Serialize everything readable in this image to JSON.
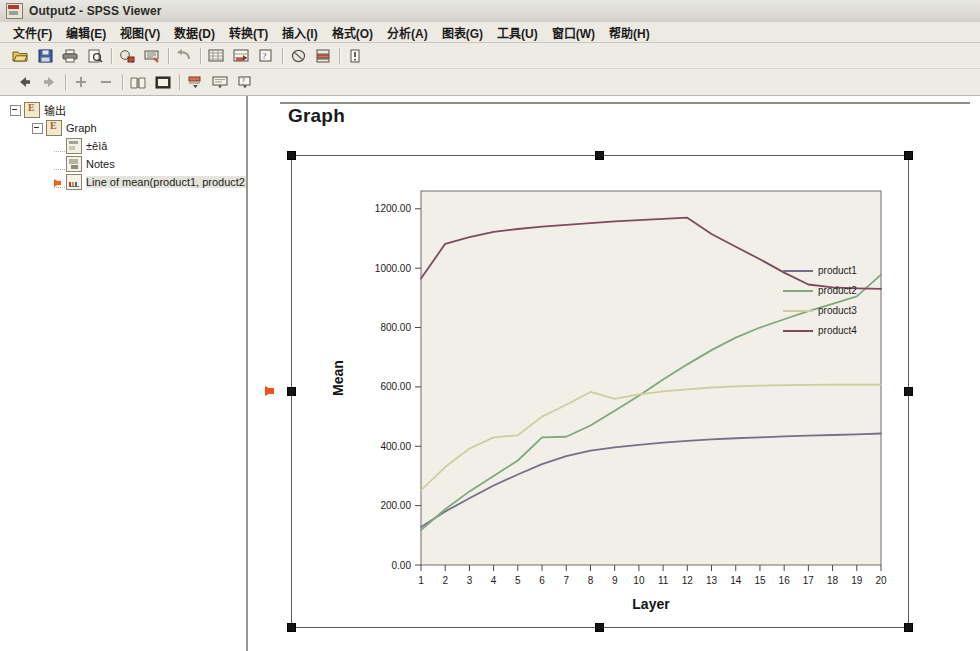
{
  "window": {
    "title": "Output2 - SPSS Viewer",
    "icon": "spss-viewer-icon"
  },
  "menubar": {
    "items": [
      {
        "label": "文件(F)",
        "name": "menu-file"
      },
      {
        "label": "编辑(E)",
        "name": "menu-edit"
      },
      {
        "label": "视图(V)",
        "name": "menu-view"
      },
      {
        "label": "数据(D)",
        "name": "menu-data"
      },
      {
        "label": "转换(T)",
        "name": "menu-transform"
      },
      {
        "label": "插入(I)",
        "name": "menu-insert"
      },
      {
        "label": "格式(O)",
        "name": "menu-format"
      },
      {
        "label": "分析(A)",
        "name": "menu-analyze"
      },
      {
        "label": "图表(G)",
        "name": "menu-graphs"
      },
      {
        "label": "工具(U)",
        "name": "menu-utilities"
      },
      {
        "label": "窗口(W)",
        "name": "menu-window"
      },
      {
        "label": "帮助(H)",
        "name": "menu-help"
      }
    ]
  },
  "toolbar_main": {
    "buttons": [
      {
        "name": "open-file-icon"
      },
      {
        "name": "save-icon"
      },
      {
        "name": "print-icon"
      },
      {
        "name": "print-preview-icon"
      },
      {
        "name": "recall-dialog-icon"
      },
      {
        "name": "dialog-recall-list-icon"
      },
      {
        "name": "undo-icon"
      },
      {
        "name": "goto-data-icon"
      },
      {
        "name": "goto-case-icon"
      },
      {
        "name": "variables-icon"
      },
      {
        "name": "find-icon"
      },
      {
        "name": "insert-cases-icon"
      },
      {
        "name": "use-sets-icon"
      }
    ]
  },
  "toolbar_outline": {
    "buttons": [
      {
        "name": "promote-back-icon"
      },
      {
        "name": "demote-forward-icon"
      },
      {
        "name": "expand-icon"
      },
      {
        "name": "collapse-icon"
      },
      {
        "name": "show-book-icon"
      },
      {
        "name": "hide-panel-icon"
      },
      {
        "name": "insert-heading-icon"
      },
      {
        "name": "insert-title-icon"
      },
      {
        "name": "insert-text-icon"
      }
    ]
  },
  "outline": {
    "nodes": [
      {
        "label": "输出",
        "name": "outline-node-output",
        "icon": "output-icon",
        "depth": 0,
        "expanded": true,
        "selected": false
      },
      {
        "label": "Graph",
        "name": "outline-node-graph",
        "icon": "output-icon",
        "depth": 1,
        "expanded": true,
        "selected": false
      },
      {
        "label": "±êìâ",
        "name": "outline-node-title",
        "icon": "title-icon",
        "depth": 2,
        "expanded": false,
        "selected": false
      },
      {
        "label": "Notes",
        "name": "outline-node-notes",
        "icon": "notes-icon",
        "depth": 2,
        "expanded": false,
        "selected": false
      },
      {
        "label": "Line of mean(product1, product2, p",
        "name": "outline-node-chart",
        "icon": "chart-icon",
        "depth": 2,
        "expanded": false,
        "selected": true
      }
    ]
  },
  "document": {
    "heading": "Graph"
  },
  "chart_data": {
    "type": "line",
    "title": "",
    "xlabel": "Layer",
    "ylabel": "Mean",
    "xlim": [
      1,
      20
    ],
    "ylim": [
      0,
      1260
    ],
    "ytick_labels": [
      "0.00",
      "200.00",
      "400.00",
      "600.00",
      "800.00",
      "1000.00",
      "1200.00"
    ],
    "ytick_values": [
      0,
      200,
      400,
      600,
      800,
      1000,
      1200
    ],
    "xtick_labels": [
      "1",
      "2",
      "3",
      "4",
      "5",
      "6",
      "7",
      "8",
      "9",
      "10",
      "11",
      "12",
      "13",
      "14",
      "15",
      "16",
      "17",
      "18",
      "19",
      "20"
    ],
    "x": [
      1,
      2,
      3,
      4,
      5,
      6,
      7,
      8,
      9,
      10,
      11,
      12,
      13,
      14,
      15,
      16,
      17,
      18,
      19,
      20
    ],
    "grid": false,
    "legend_position": "right",
    "series": [
      {
        "name": "product1",
        "color": "#756f8a",
        "values": [
          128,
          180,
          225,
          268,
          305,
          340,
          367,
          385,
          396,
          405,
          412,
          418,
          423,
          427,
          430,
          433,
          436,
          438,
          440,
          443
        ]
      },
      {
        "name": "product2",
        "color": "#7fa87f",
        "values": [
          118,
          188,
          248,
          300,
          352,
          430,
          432,
          470,
          520,
          570,
          625,
          676,
          724,
          766,
          800,
          828,
          855,
          880,
          905,
          978
        ]
      },
      {
        "name": "product3",
        "color": "#cfcda0",
        "values": [
          252,
          330,
          392,
          430,
          437,
          500,
          540,
          583,
          560,
          575,
          585,
          592,
          598,
          602,
          604,
          606,
          607,
          608,
          608,
          608
        ]
      },
      {
        "name": "product4",
        "color": "#7d4a5e",
        "values": [
          965,
          1082,
          1105,
          1122,
          1132,
          1140,
          1146,
          1152,
          1158,
          1162,
          1166,
          1170,
          1115,
          1072,
          1030,
          985,
          945,
          935,
          932,
          930
        ]
      }
    ]
  },
  "selection": {
    "object": "chart-object",
    "handles": [
      "nw",
      "n",
      "ne",
      "w",
      "e",
      "sw",
      "s",
      "se"
    ],
    "edit_marker": "edit-pointer-arrow"
  }
}
